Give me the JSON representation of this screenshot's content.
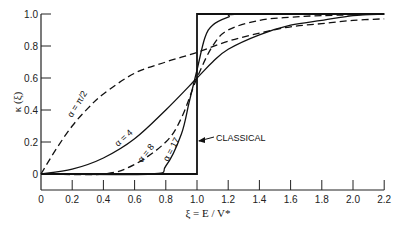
{
  "chart_data": {
    "type": "line",
    "title": "",
    "xlabel": "ξ = E / V*",
    "ylabel": "κ (ξ)",
    "xlim": [
      0,
      2.2
    ],
    "ylim": [
      0,
      1.0
    ],
    "x_ticks": [
      "0",
      "0.2",
      "0.4",
      "0.6",
      "0.8",
      "1.0",
      "1.2",
      "1.4",
      "1.6",
      "1.8",
      "2.0",
      "2.2"
    ],
    "y_ticks": [
      "0",
      "0.2",
      "0.4",
      "0.6",
      "0.8",
      "1.0"
    ],
    "grid": false,
    "legend": "inline labels",
    "series": [
      {
        "name": "α = π/2",
        "style": "dashed",
        "x": [
          0,
          0.1,
          0.2,
          0.3,
          0.4,
          0.6,
          0.8,
          1.0,
          1.2,
          1.4,
          1.6,
          1.8,
          2.0,
          2.2
        ],
        "values": [
          0,
          0.16,
          0.3,
          0.41,
          0.5,
          0.63,
          0.7,
          0.76,
          0.83,
          0.88,
          0.92,
          0.94,
          0.96,
          0.97
        ]
      },
      {
        "name": "α = 4",
        "style": "solid",
        "x": [
          0,
          0.2,
          0.4,
          0.6,
          0.8,
          1.0,
          1.1,
          1.2,
          1.4,
          1.6,
          1.8,
          2.0,
          2.2
        ],
        "values": [
          0,
          0.03,
          0.1,
          0.22,
          0.4,
          0.6,
          0.7,
          0.78,
          0.87,
          0.93,
          0.96,
          0.99,
          1.0
        ]
      },
      {
        "name": "α = 8",
        "style": "dashed",
        "x": [
          0,
          0.4,
          0.6,
          0.8,
          0.9,
          1.0,
          1.1,
          1.2,
          1.4,
          1.6,
          1.8,
          2.2
        ],
        "values": [
          0,
          0,
          0.06,
          0.2,
          0.35,
          0.6,
          0.8,
          0.9,
          0.96,
          0.98,
          0.99,
          1.0
        ]
      },
      {
        "name": "α = 17",
        "style": "solid",
        "x": [
          0,
          0.7,
          0.8,
          0.9,
          0.95,
          1.0,
          1.05,
          1.1,
          1.2,
          1.3,
          2.2
        ],
        "values": [
          0,
          0,
          0.05,
          0.25,
          0.45,
          0.65,
          0.85,
          0.93,
          0.98,
          1.0,
          1.0
        ]
      },
      {
        "name": "CLASSICAL",
        "style": "solid",
        "x": [
          0,
          1.0,
          1.0,
          2.2
        ],
        "values": [
          0,
          0,
          1.0,
          1.0
        ]
      }
    ],
    "annotations": [
      "α = π/2",
      "α = 4",
      "α = 8",
      "α = 17",
      "CLASSICAL"
    ]
  },
  "labels": {
    "xlabel": "ξ = E / V*",
    "ylabel": "κ (ξ)",
    "alpha_pi2": "α = π/2",
    "alpha_4": "α = 4",
    "alpha_8": "α = 8",
    "alpha_17": "α = 17",
    "classical": "CLASSICAL"
  }
}
